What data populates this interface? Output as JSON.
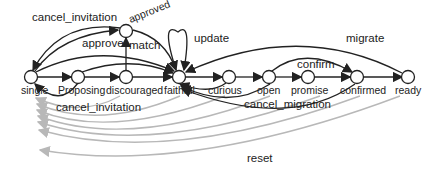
{
  "diagram": {
    "type": "state-transition",
    "states": [
      {
        "id": "single",
        "label": "single"
      },
      {
        "id": "proposing",
        "label": "Proposing"
      },
      {
        "id": "discouraged",
        "label": "discouraged"
      },
      {
        "id": "faithful",
        "label": "faithful"
      },
      {
        "id": "curious",
        "label": "curious"
      },
      {
        "id": "open",
        "label": "open"
      },
      {
        "id": "promise",
        "label": "promise"
      },
      {
        "id": "confirmed",
        "label": "confirmed"
      },
      {
        "id": "ready",
        "label": "ready"
      },
      {
        "id": "approved",
        "label": "approved"
      }
    ],
    "edge_labels": {
      "cancel_invitation_top": "cancel_invitation",
      "approve": "approve",
      "match": "match",
      "update": "update",
      "migrate": "migrate",
      "confirm": "confirm",
      "cancel_invitation_bottom": "cancel_invitation",
      "cancel_migration": "cancel_migration",
      "reset": "reset"
    },
    "colors": {
      "edge": "#222222",
      "reset_edge": "#b8b8b8",
      "node_fill": "#ffffff"
    }
  }
}
